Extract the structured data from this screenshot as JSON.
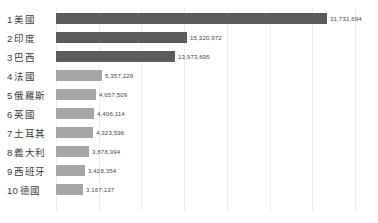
{
  "chart_data": {
    "type": "bar",
    "orientation": "horizontal",
    "title": "",
    "subtitle": "",
    "xlabel": "",
    "ylabel": "",
    "grid": true,
    "legend": "none",
    "xlim": [
      0,
      35000000
    ],
    "gridline_values": [
      0,
      5000000,
      10000000,
      15000000,
      20000000,
      25000000,
      30000000,
      35000000
    ],
    "categories": [
      "美國",
      "印度",
      "巴西",
      "法國",
      "俄羅斯",
      "英國",
      "土耳其",
      "義大利",
      "西班牙",
      "德國"
    ],
    "ranks": [
      "1",
      "2",
      "3",
      "4",
      "5",
      "6",
      "7",
      "8",
      "9",
      "10"
    ],
    "values": [
      31731694,
      15320972,
      13973695,
      5357229,
      4657509,
      4406114,
      4323596,
      3878994,
      3428354,
      3167137
    ],
    "value_labels": [
      "31,731,694",
      "15,320,972",
      "13,973,695",
      "5,357,229",
      "4,657,509",
      "4,406,114",
      "4,323,596",
      "3,878,994",
      "3,428,354",
      "3,167,137"
    ],
    "bar_colors": [
      "#5c5c5c",
      "#5c5c5c",
      "#5c5c5c",
      "#a6a6a6",
      "#a6a6a6",
      "#a6a6a6",
      "#a6a6a6",
      "#a6a6a6",
      "#a6a6a6",
      "#a6a6a6"
    ],
    "highlight_color": "#5c5c5c",
    "base_color": "#a6a6a6",
    "gridline_color": "#ededed",
    "background_color": "#ffffff",
    "label_color": "#3d3d3d"
  },
  "rows": [
    {
      "rank": "1",
      "name": "美國",
      "value_label": "31,731,694"
    },
    {
      "rank": "2",
      "name": "印度",
      "value_label": "15,320,972"
    },
    {
      "rank": "3",
      "name": "巴西",
      "value_label": "13,973,695"
    },
    {
      "rank": "4",
      "name": "法國",
      "value_label": "5,357,229"
    },
    {
      "rank": "5",
      "name": "俄羅斯",
      "value_label": "4,657,509"
    },
    {
      "rank": "6",
      "name": "英國",
      "value_label": "4,406,114"
    },
    {
      "rank": "7",
      "name": "土耳其",
      "value_label": "4,323,596"
    },
    {
      "rank": "8",
      "name": "義大利",
      "value_label": "3,878,994"
    },
    {
      "rank": "9",
      "name": "西班牙",
      "value_label": "3,428,354"
    },
    {
      "rank": "10",
      "name": "德國",
      "value_label": "3,167,137"
    }
  ],
  "caption": ""
}
